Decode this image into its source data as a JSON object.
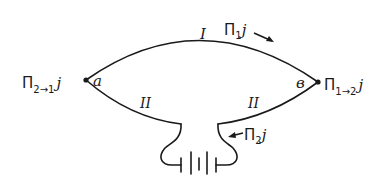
{
  "diagram": {
    "type": "thermocouple circuit",
    "nodes": {
      "a": {
        "label": "a",
        "x": 86,
        "y": 80
      },
      "b": {
        "label": "в",
        "x": 318,
        "y": 82
      }
    },
    "conductors": {
      "upper": {
        "label": "I"
      },
      "lower_left": {
        "label": "II"
      },
      "lower_right": {
        "label": "II"
      }
    },
    "annotations": {
      "upper_flux": {
        "symbol": "Π",
        "sub": "1",
        "tail": "j",
        "arrow": "→"
      },
      "lower_flux": {
        "arrow": "←",
        "symbol": "Π",
        "sub": "2",
        "tail": "j"
      },
      "junction_a_heat": {
        "symbol": "Π",
        "sub": "2→1",
        "tail": "j"
      },
      "junction_b_heat": {
        "symbol": "Π",
        "sub": "1→2",
        "tail": "j"
      }
    },
    "source": {
      "type": "battery",
      "cells": 2
    },
    "colors": {
      "stroke": "#1a1a1a",
      "background": "#ffffff"
    }
  }
}
